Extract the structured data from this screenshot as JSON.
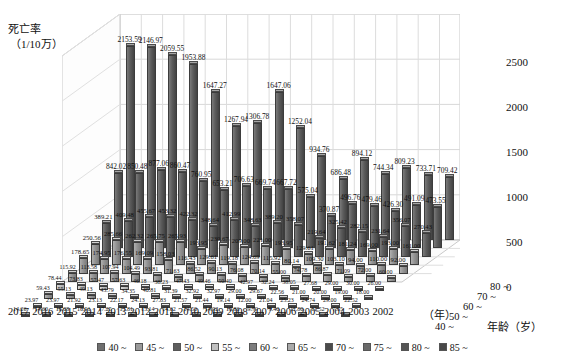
{
  "chart_data": {
    "type": "bar",
    "ylabel_line1": "死亡率",
    "ylabel_line2": "（1/10万）",
    "xlabel": "（年）",
    "zlabel": "年龄（岁）",
    "ylim": [
      0,
      2500
    ],
    "yticks": [
      "0",
      "500",
      "1000",
      "1500",
      "2000",
      "2500"
    ],
    "grid": true,
    "legend_position": "bottom",
    "categories": [
      "2017",
      "2016",
      "2015",
      "2014",
      "2013",
      "2012",
      "2011",
      "2010",
      "2009",
      "2008",
      "2007",
      "2006",
      "2005",
      "2004",
      "2003",
      "2002"
    ],
    "depth_axis_ticks": [
      "40 ~",
      "50 ~",
      "60 ~",
      "70 ~",
      "80 ~"
    ],
    "legend_entries": [
      "40 ~",
      "45 ~",
      "50 ~",
      "55 ~",
      "60 ~",
      "65 ~",
      "70 ~",
      "75 ~",
      "80 ~",
      "85 ~"
    ],
    "series": [
      {
        "name": "85 ~",
        "values": [
          2153.59,
          2146.97,
          2059.55,
          1953.88,
          1647.27,
          1267.94,
          1306.78,
          1647.06,
          1252.04,
          934.76,
          686.48,
          894.12,
          744.34,
          809.23,
          733.71,
          709.42
        ]
      },
      {
        "name": "80 ~",
        "values": [
          842.02,
          850.48,
          877.06,
          860.47,
          760.95,
          653.21,
          706.63,
          669.74,
          667.72,
          575.04,
          370.87,
          496.76,
          479.46,
          426.3,
          491.09,
          473.55
        ]
      },
      {
        "name": "75 ~",
        "values": [
          389.21,
          409.48,
          455.67,
          453.32,
          422.32,
          348.64,
          412.99,
          348.63,
          389.2,
          358.07,
          219.64,
          325.42,
          282.15,
          231.64,
          356.07,
          270.43
        ]
      },
      {
        "name": "70 ~",
        "values": [
          250.56,
          285.66,
          262.32,
          265.75,
          265.93,
          193.95,
          230.67,
          209.0,
          221.0,
          193.95,
          129.61,
          191.62,
          181.24,
          169.0,
          193.0,
          161.0
        ]
      },
      {
        "name": "65 ~",
        "values": [
          178.65,
          174.95,
          176.55,
          169.09,
          158.03,
          116.43,
          129.61,
          119.18,
          124.69,
          115.92,
          80.14,
          109.3,
          103.1,
          94.0,
          110.0,
          92.0
        ]
      },
      {
        "name": "60 ~",
        "values": [
          115.92,
          113.58,
          107.94,
          104.49,
          93.81,
          71.63,
          86.52,
          90.13,
          76.08,
          70.14,
          55.0,
          74.78,
          86.87,
          71.09,
          72.0,
          60.0
        ]
      },
      {
        "name": "55 ~",
        "values": [
          78.44,
          73.83,
          57.47,
          57.63,
          46.18,
          38.23,
          47.43,
          49.46,
          50.4,
          42.97,
          32.24,
          38.05,
          27.68,
          29.0,
          30.0,
          26.0
        ]
      },
      {
        "name": "50 ~",
        "values": [
          59.43,
          55.13,
          49.13,
          43.79,
          34.35,
          40.81,
          31.39,
          32.92,
          32.97,
          29.0,
          29.67,
          22.56,
          21.0,
          20.0,
          19.0,
          18.0
        ]
      },
      {
        "name": "45 ~",
        "values": [
          23.97,
          23.97,
          21.92,
          23.13,
          22.17,
          24.13,
          27.83,
          21.57,
          21.44,
          19.14,
          12.0,
          21.04,
          25.23,
          24.74,
          29.0,
          22.52
        ]
      },
      {
        "name": "40 ~",
        "values": [
          14.26,
          14.6,
          16.08,
          16.91,
          17.25,
          13.81,
          15.14,
          14.62,
          14.5,
          14.92,
          10.86,
          9.79,
          9.4,
          11.8,
          11.52,
          7.65
        ]
      }
    ]
  },
  "legend": {
    "items": [
      {
        "label": "40 ~",
        "color": "#6f6f6f"
      },
      {
        "label": "45 ~",
        "color": "#9a9a9a"
      },
      {
        "label": "50 ~",
        "color": "#5e5e5e"
      },
      {
        "label": "55 ~",
        "color": "#c0c0c0"
      },
      {
        "label": "60 ~",
        "color": "#7d7d7d"
      },
      {
        "label": "65 ~",
        "color": "#aaaaaa"
      },
      {
        "label": "70 ~",
        "color": "#4b4b4b"
      },
      {
        "label": "75 ~",
        "color": "#6a6a6a"
      },
      {
        "label": "80 ~",
        "color": "#555555"
      },
      {
        "label": "85 ~",
        "color": "#484848"
      }
    ]
  }
}
